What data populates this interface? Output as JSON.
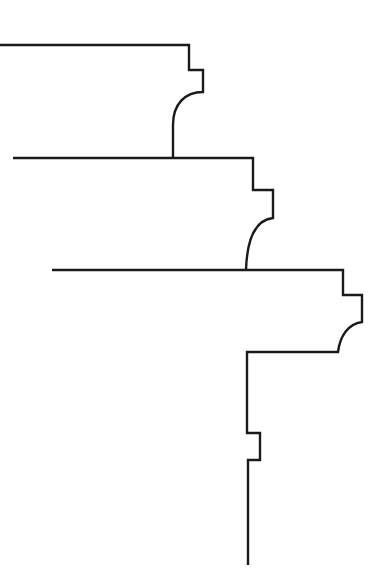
{
  "diagram": {
    "type": "architectural-molding-profile",
    "background": "#ffffff",
    "stroke_color": "#1a1a1a",
    "profiles": [
      {
        "name": "upper-cornice-profile",
        "path": "M0,45 L189,45 L189,70 L203,70 L203,92 C185,92 173,104 173,125 L173,158"
      },
      {
        "name": "middle-cornice-profile",
        "path": "M13,158 L253,158 L253,190 L273,190 L273,218 C255,220 247,240 246,270"
      },
      {
        "name": "lower-cornice-profile",
        "path": "M52,270 L343,270 L343,295 L362,295 L362,322 C348,324 340,336 338,352 L247,352 L247,433 L260,433 L260,460 L248,460 L248,565"
      }
    ]
  }
}
